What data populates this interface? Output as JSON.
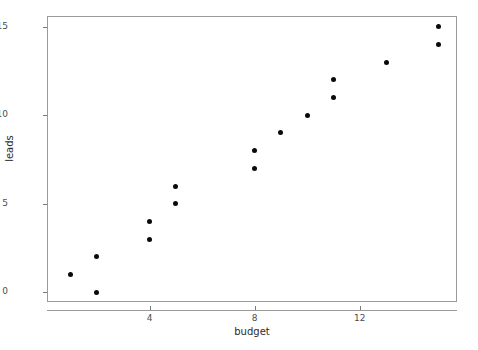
{
  "chart_data": {
    "type": "scatter",
    "title": "",
    "xlabel": "budget",
    "ylabel": "leads",
    "xlim": [
      0.1,
      15.7
    ],
    "ylim": [
      -0.55,
      15.6
    ],
    "xticks": [
      4,
      8,
      12
    ],
    "xtick_labels": [
      "4",
      "8",
      "12"
    ],
    "yticks": [
      0,
      5,
      10,
      15
    ],
    "ytick_labels": [
      "0",
      "5",
      "10",
      "15"
    ],
    "grid": false,
    "legend": null,
    "marker": {
      "shape": "circle",
      "color": "#0a0a0a",
      "size_px": 5
    },
    "points": [
      {
        "budget": 1,
        "leads": 1
      },
      {
        "budget": 2,
        "leads": 0
      },
      {
        "budget": 2,
        "leads": 2
      },
      {
        "budget": 4,
        "leads": 3
      },
      {
        "budget": 4,
        "leads": 4
      },
      {
        "budget": 5,
        "leads": 5
      },
      {
        "budget": 5,
        "leads": 6
      },
      {
        "budget": 8,
        "leads": 7
      },
      {
        "budget": 8,
        "leads": 8
      },
      {
        "budget": 9,
        "leads": 9
      },
      {
        "budget": 10,
        "leads": 10
      },
      {
        "budget": 11,
        "leads": 11
      },
      {
        "budget": 11,
        "leads": 12
      },
      {
        "budget": 13,
        "leads": 13
      },
      {
        "budget": 15,
        "leads": 14
      },
      {
        "budget": 15,
        "leads": 15
      }
    ]
  },
  "panel": {
    "frame_color": "#9a9a9a",
    "background": "#ffffff",
    "axis_text_color": "#4d4d4d",
    "axis_title_color": "#2b2b2b"
  }
}
